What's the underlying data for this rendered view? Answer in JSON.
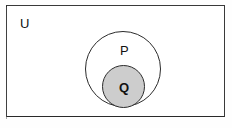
{
  "diagram": {
    "type": "venn-diagram",
    "universal_set": {
      "label": "U",
      "shape": "rectangle",
      "fill": "#ffffff",
      "stroke": "#2b2b2b"
    },
    "sets": [
      {
        "label": "P",
        "shape": "circle",
        "fill": "none",
        "stroke": "#2b2b2b",
        "shaded": false
      },
      {
        "label": "Q",
        "shape": "circle",
        "fill": "#cdcdcd",
        "stroke": "#2b2b2b",
        "shaded": true
      }
    ]
  },
  "colors": {
    "background": "#ffffff",
    "line": "#2b2b2b",
    "shading": "#cdcdcd",
    "text": "#111111"
  }
}
